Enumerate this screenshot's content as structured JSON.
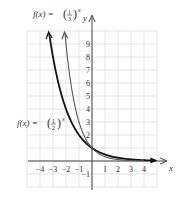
{
  "chart_data": {
    "type": "line",
    "title": "",
    "xlabel": "x",
    "ylabel": "y",
    "xlim": [
      -5,
      5
    ],
    "ylim": [
      -2,
      10
    ],
    "grid": true,
    "x_ticks": [
      -4,
      -3,
      -2,
      -1,
      1,
      2,
      3,
      4
    ],
    "y_ticks": [
      -1,
      2,
      3,
      4,
      5,
      6,
      7,
      8,
      9
    ],
    "series": [
      {
        "name": "f(x) = (1/2)^x",
        "base": 0.5,
        "color": "#111111",
        "x": [
          -3.3,
          -3,
          -2,
          -1,
          0,
          1,
          2,
          3,
          4,
          4.9
        ],
        "values": [
          9.85,
          8,
          4,
          2,
          1,
          0.5,
          0.25,
          0.125,
          0.0625,
          0.0335
        ]
      },
      {
        "name": "f(x) = (1/3)^x",
        "base": 0.3333,
        "color": "#555555",
        "x": [
          -2.08,
          -2,
          -1,
          0,
          1,
          2,
          3,
          4
        ],
        "values": [
          9.83,
          9,
          3,
          1,
          0.333,
          0.111,
          0.037,
          0.012
        ]
      }
    ]
  },
  "labels": {
    "f_third": {
      "lhs": "f(x) =",
      "num": "1",
      "den": "3",
      "exp": "x"
    },
    "f_half": {
      "lhs": "f(x) =",
      "num": "1",
      "den": "2",
      "exp": "x"
    },
    "x_axis": "x",
    "y_axis": "y"
  }
}
